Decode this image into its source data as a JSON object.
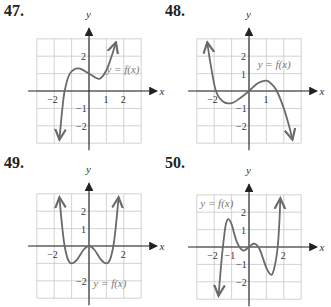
{
  "chart_data": [
    {
      "type": "line",
      "id": "47",
      "title": "47.",
      "xlabel": "x",
      "ylabel": "y",
      "xlim": [
        -3,
        3
      ],
      "ylim": [
        -3,
        3
      ],
      "grid": true,
      "x_ticks": [
        "-2",
        "1",
        "2"
      ],
      "y_ticks": [
        "2",
        "-1",
        "-2"
      ],
      "annotation": "y = f(x)",
      "points": [
        [
          -1.7,
          -2.8
        ],
        [
          -1.55,
          -1.2
        ],
        [
          -1.4,
          0
        ],
        [
          -1.1,
          1.0
        ],
        [
          -0.6,
          1.3
        ],
        [
          0,
          1.0
        ],
        [
          0.6,
          0.7
        ],
        [
          1.0,
          1.2
        ],
        [
          1.3,
          2.0
        ],
        [
          1.55,
          2.8
        ]
      ]
    },
    {
      "type": "line",
      "id": "48",
      "title": "48.",
      "xlabel": "x",
      "ylabel": "y",
      "xlim": [
        -3,
        3
      ],
      "ylim": [
        -3,
        3
      ],
      "grid": true,
      "x_ticks": [
        "-2",
        "1"
      ],
      "y_ticks": [
        "2",
        "1",
        "-1",
        "-2"
      ],
      "annotation": "y = f(x)",
      "points": [
        [
          -2.4,
          2.8
        ],
        [
          -2.2,
          1.5
        ],
        [
          -1.9,
          0
        ],
        [
          -1.5,
          -0.6
        ],
        [
          -1,
          -0.7
        ],
        [
          -0.5,
          -0.4
        ],
        [
          0,
          0
        ],
        [
          0.5,
          0.45
        ],
        [
          1,
          0.6
        ],
        [
          1.3,
          0.4
        ],
        [
          1.6,
          0
        ],
        [
          2.0,
          -1.0
        ],
        [
          2.3,
          -2.0
        ],
        [
          2.5,
          -2.8
        ]
      ]
    },
    {
      "type": "line",
      "id": "49",
      "title": "49.",
      "xlabel": "x",
      "ylabel": "y",
      "xlim": [
        -3,
        3
      ],
      "ylim": [
        -3,
        3
      ],
      "grid": true,
      "x_ticks": [
        "-2",
        "2"
      ],
      "y_ticks": [
        "2",
        "1",
        "-2"
      ],
      "annotation": "y = f(x)",
      "points": [
        [
          -1.7,
          2.8
        ],
        [
          -1.55,
          1.2
        ],
        [
          -1.4,
          0
        ],
        [
          -1.2,
          -0.8
        ],
        [
          -1,
          -1
        ],
        [
          -0.7,
          -0.8
        ],
        [
          -0.3,
          -0.2
        ],
        [
          0,
          0
        ],
        [
          0.3,
          -0.2
        ],
        [
          0.7,
          -0.8
        ],
        [
          1,
          -1
        ],
        [
          1.2,
          -0.8
        ],
        [
          1.4,
          0
        ],
        [
          1.55,
          1.2
        ],
        [
          1.7,
          2.8
        ]
      ]
    },
    {
      "type": "line",
      "id": "50",
      "title": "50.",
      "xlabel": "x",
      "ylabel": "y",
      "xlim": [
        -3,
        3
      ],
      "ylim": [
        -3,
        3
      ],
      "grid": true,
      "x_ticks": [
        "-2",
        "-1",
        "2"
      ],
      "y_ticks": [
        "2",
        "1",
        "-1",
        "-2"
      ],
      "annotation": "y = f(x)",
      "points": [
        [
          -1.75,
          -2.8
        ],
        [
          -1.6,
          -1.0
        ],
        [
          -1.5,
          0
        ],
        [
          -1.35,
          1.2
        ],
        [
          -1.2,
          1.6
        ],
        [
          -1.0,
          1.3
        ],
        [
          -0.7,
          0.3
        ],
        [
          -0.35,
          -0.2
        ],
        [
          0,
          0
        ],
        [
          0.3,
          0.2
        ],
        [
          0.6,
          -0.1
        ],
        [
          1.0,
          -1.2
        ],
        [
          1.3,
          -1.6
        ],
        [
          1.5,
          -1.0
        ],
        [
          1.65,
          0
        ],
        [
          1.75,
          1.5
        ],
        [
          1.8,
          2.8
        ]
      ]
    }
  ],
  "graphs": [
    {
      "title": "47.",
      "xlabel": "x",
      "ylabel": "y",
      "annotation": "y = f(x)"
    },
    {
      "title": "48.",
      "xlabel": "x",
      "ylabel": "y",
      "annotation": "y = f(x)"
    },
    {
      "title": "49.",
      "xlabel": "x",
      "ylabel": "y",
      "annotation": "y = f(x)"
    },
    {
      "title": "50.",
      "xlabel": "x",
      "ylabel": "y",
      "annotation": "y = f(x)"
    }
  ]
}
